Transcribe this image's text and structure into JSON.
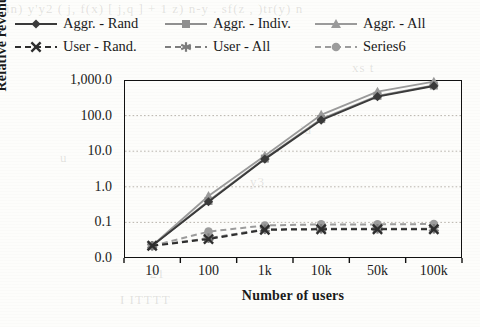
{
  "chart_data": {
    "type": "line",
    "title": "",
    "xlabel": "Number of users",
    "ylabel": "Relative revenue",
    "categories": [
      "10",
      "100",
      "1k",
      "10k",
      "50k",
      "100k"
    ],
    "yscale": "log",
    "ytick_labels": [
      "1,000.0",
      "100.0",
      "10.0",
      "1.0",
      "0.1",
      "0.0"
    ],
    "ytick_values": [
      1000.0,
      100.0,
      10.0,
      1.0,
      0.1,
      0.0
    ],
    "ylim": [
      0.02,
      1000
    ],
    "grid": "horizontal-dotted",
    "legend_position": "top",
    "series": [
      {
        "name": "Aggr. - Rand",
        "marker": "diamond",
        "linestyle": "solid",
        "color": "#3a3a3a",
        "values": [
          0.022,
          0.38,
          6.0,
          75.0,
          340.0,
          680.0
        ]
      },
      {
        "name": "Aggr. - Indiv.",
        "marker": "square",
        "linestyle": "solid",
        "color": "#8f8f8f",
        "values": [
          0.022,
          0.4,
          6.2,
          80.0,
          360.0,
          700.0
        ]
      },
      {
        "name": "Aggr. - All",
        "marker": "triangle",
        "linestyle": "solid",
        "color": "#9a9a9a",
        "values": [
          0.022,
          0.55,
          7.5,
          105.0,
          470.0,
          900.0
        ]
      },
      {
        "name": "User - Rand.",
        "marker": "x-cross",
        "linestyle": "dashed",
        "color": "#2e2e2e",
        "values": [
          0.022,
          0.034,
          0.062,
          0.064,
          0.064,
          0.064
        ]
      },
      {
        "name": "User - All",
        "marker": "star",
        "linestyle": "dashed",
        "color": "#7d7d7d",
        "values": [
          0.022,
          0.036,
          0.064,
          0.066,
          0.066,
          0.066
        ]
      },
      {
        "name": "Series6",
        "marker": "circle",
        "linestyle": "dashed",
        "color": "#9c9c9c",
        "values": [
          0.022,
          0.055,
          0.082,
          0.088,
          0.088,
          0.09
        ]
      }
    ]
  },
  "axes": {
    "y_title": "Relative revenue",
    "x_title": "Number of users"
  },
  "legend": {
    "items": [
      {
        "label": "Aggr. - Rand",
        "marker": "diamond",
        "linestyle": "solid",
        "color": "#3a3a3a"
      },
      {
        "label": "Aggr. - Indiv.",
        "marker": "square",
        "linestyle": "solid",
        "color": "#8f8f8f"
      },
      {
        "label": "Aggr. - All",
        "marker": "triangle",
        "linestyle": "solid",
        "color": "#9a9a9a"
      },
      {
        "label": "User - Rand.",
        "marker": "x-cross",
        "linestyle": "dashed",
        "color": "#2e2e2e"
      },
      {
        "label": "User - All",
        "marker": "star",
        "linestyle": "dashed",
        "color": "#7d7d7d"
      },
      {
        "label": "Series6",
        "marker": "circle",
        "linestyle": "dashed",
        "color": "#9c9c9c"
      }
    ]
  },
  "scan_artifacts": {
    "ghost_lines": [
      {
        "text": "in) y'y2 ( j, f(x) [ j,q ] + 1 z) n-y . sf(z , )tr(y) n",
        "x": 6,
        "y": 1
      },
      {
        "text": "xs t",
        "x": 352,
        "y": 60
      },
      {
        "text": "id",
        "x": 300,
        "y": 122
      },
      {
        "text": "y3",
        "x": 250,
        "y": 174
      },
      {
        "text": "21",
        "x": 150,
        "y": 266
      },
      {
        "text": "I   ITTTT",
        "x": 120,
        "y": 292
      },
      {
        "text": "u",
        "x": 60,
        "y": 150
      }
    ]
  }
}
